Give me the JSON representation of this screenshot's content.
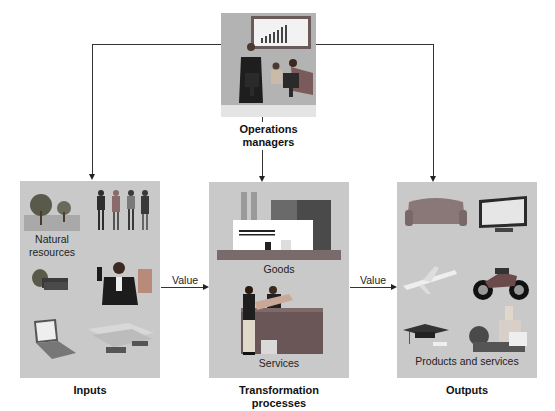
{
  "diagram": {
    "top": {
      "label_line1": "Operations",
      "label_line2": "managers",
      "illustration": "managers-at-computers-with-chart"
    },
    "boxes": [
      {
        "id": "inputs",
        "caption": "Inputs",
        "inner_labels": [
          "Natural",
          "resources"
        ],
        "illustrations": [
          "trees",
          "workers-group",
          "money-bags",
          "presenter-man",
          "laptop",
          "steel-beams"
        ]
      },
      {
        "id": "transformation",
        "caption_line1": "Transformation",
        "caption_line2": "processes",
        "inner_labels": [
          "Goods",
          "Services"
        ],
        "illustrations": [
          "factory",
          "service-counter"
        ]
      },
      {
        "id": "outputs",
        "caption": "Outputs",
        "inner_labels": [
          "Products and services"
        ],
        "illustrations": [
          "sofa",
          "flat-tv",
          "airplane",
          "motorcycle",
          "graduation-cap",
          "cups-bottles"
        ]
      }
    ],
    "edges": [
      {
        "from": "operations-managers",
        "to": "inputs"
      },
      {
        "from": "operations-managers",
        "to": "transformation"
      },
      {
        "from": "operations-managers",
        "to": "outputs"
      },
      {
        "from": "inputs",
        "to": "transformation",
        "label": "Value"
      },
      {
        "from": "transformation",
        "to": "outputs",
        "label": "Value"
      }
    ],
    "colors": {
      "box_fill": "#c9c9c9",
      "top_fill": "#b0b0b0",
      "line": "#333333"
    }
  }
}
